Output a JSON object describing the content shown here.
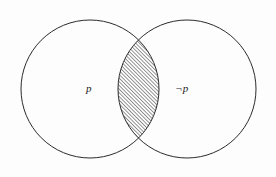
{
  "figure": {
    "type": "venn-diagram",
    "title": "",
    "background_color": "#fdfdfd",
    "stroke_color": "#2b2b2b",
    "stroke_width": 1,
    "hatch_color": "#303030",
    "hatch_spacing_px": 2.6,
    "hatch_angle_deg": 45,
    "hatch_direction": "lower-left-to-upper-right"
  },
  "sets": [
    {
      "id": "left-circle",
      "label": "p",
      "label_x": 86,
      "label_y": 83,
      "cx": 90,
      "cy": 89,
      "r": 69,
      "fill": "none"
    },
    {
      "id": "right-circle",
      "label": "¬p",
      "label_x": 175,
      "label_y": 83,
      "cx": 187,
      "cy": 89,
      "r": 69,
      "fill": "none"
    }
  ],
  "regions": [
    {
      "id": "intersection-lens",
      "name": "intersection",
      "shaded": true,
      "pattern": "diagonal-hatch",
      "top_vertex": {
        "x": 138,
        "y": 25
      },
      "bottom_vertex": {
        "x": 138,
        "y": 152
      },
      "left_extent_x": 108,
      "right_extent_x": 168
    }
  ],
  "canvas": {
    "width": 276,
    "height": 177
  }
}
